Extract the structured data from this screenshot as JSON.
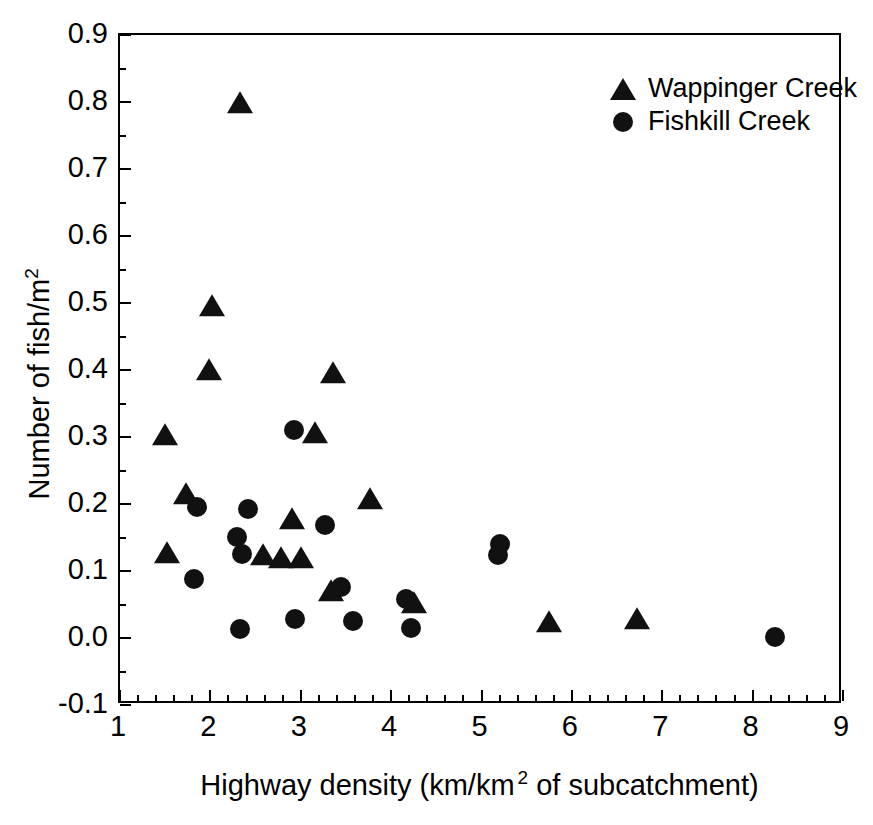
{
  "chart_data": {
    "type": "scatter",
    "title": "",
    "xlabel": "Highway density (km/km 2 of subcatchment)",
    "xlabel_parts": {
      "before": "Highway density (km/km",
      "sup": "2",
      "after": " of subcatchment)"
    },
    "ylabel": "Number of fish/m2",
    "ylabel_parts": {
      "before": "Number of fish/m",
      "sup": "2"
    },
    "xlim": [
      1,
      9
    ],
    "ylim": [
      -0.1,
      0.9
    ],
    "x_ticks": [
      1,
      2,
      3,
      4,
      5,
      6,
      7,
      8,
      9
    ],
    "x_tick_labels": [
      "1",
      "2",
      "3",
      "4",
      "5",
      "6",
      "7",
      "8",
      "9"
    ],
    "y_ticks": [
      -0.1,
      0.0,
      0.1,
      0.2,
      0.3,
      0.4,
      0.5,
      0.6,
      0.7,
      0.8,
      0.9
    ],
    "y_tick_labels": [
      "-0.1",
      "0.0",
      "0.1",
      "0.2",
      "0.3",
      "0.4",
      "0.5",
      "0.6",
      "0.7",
      "0.8",
      "0.9"
    ],
    "x_minor_per_interval": 5,
    "y_minor_per_interval": 2,
    "grid": false,
    "tick_direction": "in",
    "legend_position": "top-right",
    "marker_color": "#111111",
    "series": [
      {
        "name": "Wappinger Creek",
        "marker": "triangle",
        "points": [
          [
            2.33,
            0.795
          ],
          [
            2.02,
            0.492
          ],
          [
            1.98,
            0.397
          ],
          [
            3.36,
            0.392
          ],
          [
            1.5,
            0.3
          ],
          [
            3.16,
            0.303
          ],
          [
            1.73,
            0.212
          ],
          [
            3.77,
            0.205
          ],
          [
            2.9,
            0.175
          ],
          [
            1.52,
            0.124
          ],
          [
            2.58,
            0.121
          ],
          [
            2.78,
            0.116
          ],
          [
            3.0,
            0.116
          ],
          [
            3.33,
            0.067
          ],
          [
            4.25,
            0.05
          ],
          [
            5.75,
            0.021
          ],
          [
            6.72,
            0.025
          ]
        ]
      },
      {
        "name": "Fishkill Creek",
        "marker": "circle",
        "points": [
          [
            2.93,
            0.31
          ],
          [
            1.85,
            0.196
          ],
          [
            2.42,
            0.193
          ],
          [
            3.27,
            0.168
          ],
          [
            2.3,
            0.151
          ],
          [
            5.2,
            0.141
          ],
          [
            2.35,
            0.126
          ],
          [
            5.18,
            0.124
          ],
          [
            1.82,
            0.088
          ],
          [
            3.45,
            0.076
          ],
          [
            4.17,
            0.058
          ],
          [
            2.94,
            0.028
          ],
          [
            3.58,
            0.025
          ],
          [
            2.33,
            0.014
          ],
          [
            4.22,
            0.015
          ],
          [
            8.25,
            0.002
          ]
        ]
      }
    ]
  },
  "legend": {
    "entries": [
      {
        "label": "Wappinger Creek",
        "marker": "triangle"
      },
      {
        "label": "Fishkill Creek",
        "marker": "circle"
      }
    ]
  }
}
